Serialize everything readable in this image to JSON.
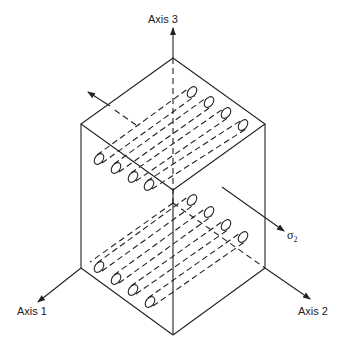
{
  "diagram": {
    "axes": [
      {
        "id": "axis-1",
        "label": "Axis 1"
      },
      {
        "id": "axis-2",
        "label": "Axis 2"
      },
      {
        "id": "axis-3",
        "label": "Axis 3"
      }
    ],
    "stress_label": {
      "symbol": "σ",
      "subscript": "2"
    },
    "fiber_layers": 2,
    "fibers_per_layer": 4,
    "colors": {
      "line": "#222222",
      "background": "#ffffff"
    }
  }
}
